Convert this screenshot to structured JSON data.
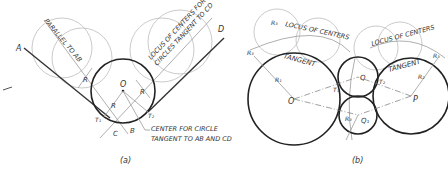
{
  "figure_a": {
    "caption": "(a)",
    "line_labels": {
      "A": "A",
      "B": "B",
      "C": "C",
      "D": "D"
    },
    "center_label": "O",
    "tangent_points": [
      "T1",
      "T2"
    ],
    "radius_label": "R",
    "annotations": {
      "parallel": "PARALLEL TO AB",
      "locus_line1": "LOCUS OF CENTERS FOR",
      "locus_line2": "CIRCLES TANGENT TO CD",
      "center_line1": "CENTER FOR CIRCLE",
      "center_line2": "TANGENT TO AB AND CD"
    }
  },
  "figure_b": {
    "caption": "(b)",
    "centers": [
      "O",
      "P",
      "Q",
      "Q1"
    ],
    "tangent_points": [
      "T1",
      "T2"
    ],
    "radius_labels": [
      "R1",
      "R2",
      "R3"
    ],
    "annotations": {
      "locus_left": "LOCUS OF CENTERS",
      "locus_right": "LOCUS OF CENTERS",
      "tangent_left": "TANGENT",
      "tangent_right": "TANGENT"
    }
  },
  "colors": {
    "ink": "#222222",
    "construction": "#bdbdbd",
    "background": "#ffffff"
  }
}
